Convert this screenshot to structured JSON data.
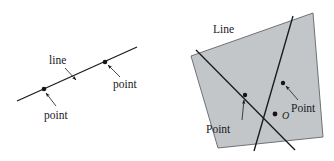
{
  "figure": {
    "background_color": "#ffffff",
    "ink_color": "#1a1a1c",
    "fill_color": "#c3c6c9"
  },
  "left_diagram": {
    "name": "line-with-two-points",
    "labels": {
      "line": "line",
      "point_upper_right": "point",
      "point_lower_left": "point"
    },
    "line": {
      "x1": 17,
      "y1": 101,
      "x2": 137,
      "y2": 47
    },
    "points": [
      {
        "name": "point-left",
        "cx": 44,
        "cy": 89
      },
      {
        "name": "point-right",
        "cx": 105,
        "cy": 62
      }
    ],
    "label_positions": {
      "line": {
        "x": 49,
        "y": 64
      },
      "point_upper_right": {
        "x": 110,
        "y": 86
      },
      "point_lower_left": {
        "x": 41,
        "y": 117
      }
    }
  },
  "right_diagram": {
    "name": "plane-with-two-lines",
    "labels": {
      "line": "Line",
      "point_left": "Point",
      "point_right": "Point",
      "intersection": "O"
    },
    "polygon_points": "191,56 313,13 323,137 218,148",
    "lines": [
      {
        "name": "line-a",
        "x1": 196,
        "y1": 50,
        "x2": 295,
        "y2": 150
      },
      {
        "name": "line-b",
        "x1": 293,
        "y1": 16,
        "x2": 254,
        "y2": 151
      }
    ],
    "points": [
      {
        "name": "point-left",
        "cx": 245,
        "cy": 95
      },
      {
        "name": "point-right",
        "cx": 283,
        "cy": 83
      },
      {
        "name": "intersection-o",
        "cx": 275,
        "cy": 114
      }
    ],
    "label_positions": {
      "line": {
        "x": 213,
        "y": 32
      },
      "point_left": {
        "x": 206,
        "y": 131
      },
      "point_right": {
        "x": 290,
        "y": 110
      },
      "intersection": {
        "x": 282,
        "y": 119
      }
    }
  }
}
